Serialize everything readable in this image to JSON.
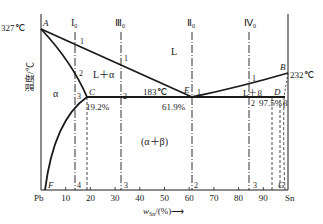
{
  "y_axis": {
    "label": "温度/℃"
  },
  "x_axis": {
    "label_main": "w",
    "label_sub": "Sn",
    "label_suffix": "/(%)",
    "arrow": "⟶",
    "left_element": "Pb",
    "right_element": "Sn",
    "ticks": [
      "10",
      "20",
      "30",
      "40",
      "50",
      "60",
      "70",
      "80",
      "90"
    ],
    "range": [
      0,
      100
    ]
  },
  "points": {
    "A": {
      "label": "A",
      "temp_label": "327℃",
      "x": 0,
      "t": 327
    },
    "B": {
      "label": "B",
      "temp_label": "232℃",
      "x": 100,
      "t": 232
    },
    "C": {
      "label": "C",
      "comp_label": "19.2%",
      "x": 19.2,
      "t": 183
    },
    "E": {
      "label": "E",
      "comp_label": "61.9%",
      "x": 61.9,
      "t": 183
    },
    "D": {
      "label": "D",
      "comp_label": "97.5%",
      "x": 97.5,
      "t": 183
    },
    "F": {
      "label": "F"
    },
    "G": {
      "label": "G"
    }
  },
  "eutectic_label": "183℃",
  "d_prefix_label": "2",
  "regions": {
    "liquid": "L",
    "l_alpha": "L＋α",
    "l_beta": "L＋β",
    "alpha": "α",
    "beta": "β",
    "alpha_beta": "(α＋β)"
  },
  "alloys": [
    {
      "name": "I",
      "sub": "0",
      "comp": 13,
      "marks": [
        "1",
        "2",
        "3",
        "4"
      ]
    },
    {
      "name": "Ⅲ",
      "sub": "0",
      "comp": 32,
      "marks": [
        "1",
        "2",
        "3"
      ]
    },
    {
      "name": "Ⅱ",
      "sub": "0",
      "comp": 61.9,
      "marks": [
        "1",
        "2"
      ]
    },
    {
      "name": "Ⅳ",
      "sub": "0",
      "comp": 85,
      "marks": [
        "1",
        "2",
        "3"
      ]
    }
  ]
}
